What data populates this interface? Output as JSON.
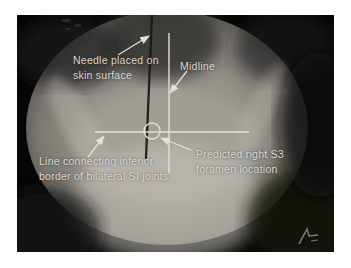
{
  "figure": {
    "annotations": {
      "needle_label": "Needle placed on\nskin surface",
      "midline_label": "Midline",
      "si_line_label": "Line connecting inferior\nborder of bilateral SI joints",
      "s3_label": "Predicted right S3\nforamen location"
    },
    "icons": {
      "signature_logo": "stylized-signature-mark"
    },
    "colors": {
      "page_background": "#ffffff",
      "frame_black": "#060606",
      "annotation_white": "#e2e0d8",
      "xray_field_gray": "#96928c",
      "needle_dark": "#181818"
    }
  }
}
